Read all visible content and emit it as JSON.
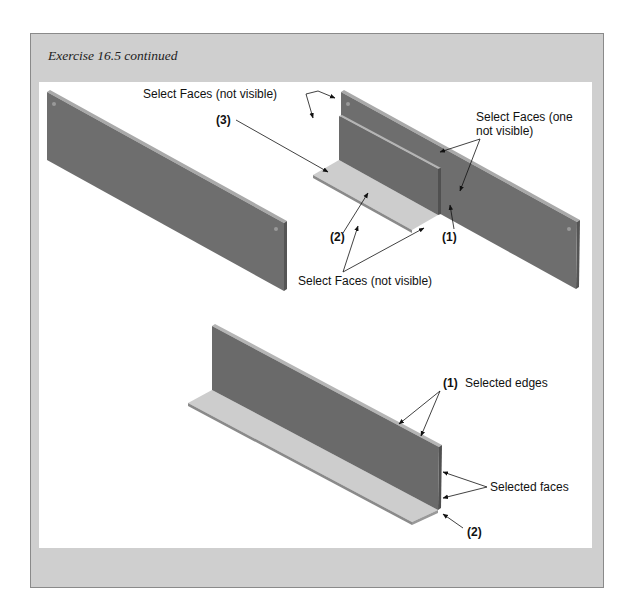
{
  "figure": {
    "title": "Exercise 16.5 continued",
    "top_left_part": {
      "description": "flat rectangular plate with mounting holes"
    },
    "top_right_assembly": {
      "labels": {
        "select_faces_top": "Select Faces (not visible)",
        "callout_3": "(3)",
        "select_faces_one_line1": "Select Faces (one",
        "select_faces_one_line2": "not visible)",
        "callout_2": "(2)",
        "callout_1": "(1)",
        "select_faces_bottom": "Select Faces (not visible)"
      }
    },
    "bottom_assembly": {
      "labels": {
        "callout_1": "(1)",
        "selected_edges": "Selected edges",
        "selected_faces": "Selected faces",
        "callout_2": "(2)"
      }
    },
    "colors": {
      "frame_gray": "#cfcfcf",
      "plate_dark": "#6e6e6e",
      "plate_edge": "#a9a9a9",
      "base_light": "#cdcdcd",
      "leader": "#111111"
    }
  }
}
